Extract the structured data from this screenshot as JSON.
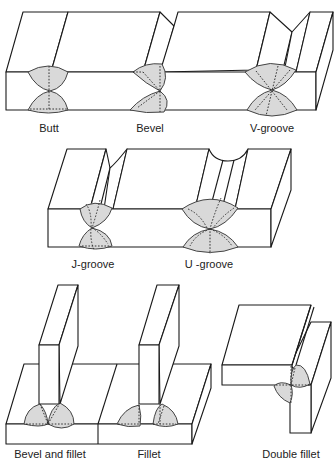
{
  "diagram": {
    "colors": {
      "line": "#1a1a1a",
      "weld_fill": "#d9d9d9",
      "background": "#ffffff"
    },
    "rows": [
      {
        "name": "top-row",
        "joints": [
          {
            "id": "butt",
            "label": "Butt",
            "x": 49,
            "y": 122
          },
          {
            "id": "bevel",
            "label": "Bevel",
            "x": 150,
            "y": 122
          },
          {
            "id": "v-groove",
            "label": "V-groove",
            "x": 272,
            "y": 122
          }
        ]
      },
      {
        "name": "middle-row",
        "joints": [
          {
            "id": "j-groove",
            "label": "J-groove",
            "x": 93,
            "y": 258
          },
          {
            "id": "u-groove",
            "label": "U -groove",
            "x": 209,
            "y": 258
          }
        ]
      },
      {
        "name": "bottom-row",
        "joints": [
          {
            "id": "bevel-and-fillet",
            "label": "Bevel and fillet",
            "x": 50,
            "y": 448
          },
          {
            "id": "fillet",
            "label": "Fillet",
            "x": 149,
            "y": 448
          },
          {
            "id": "double-fillet",
            "label": "Double fillet",
            "x": 291,
            "y": 448
          }
        ]
      }
    ]
  }
}
